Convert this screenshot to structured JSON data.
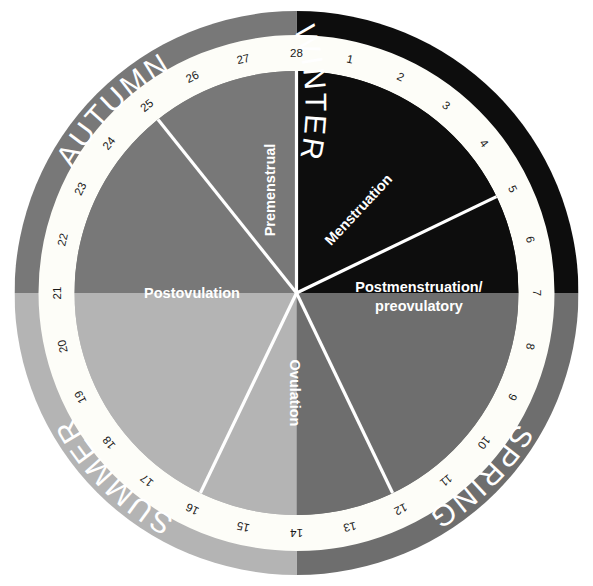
{
  "diagram": {
    "type": "radial-cycle-diagram",
    "cycle_length_days": 28,
    "colors": {
      "background": "#ffffff",
      "winter": "#0d0d0d",
      "spring": "#6e6e6e",
      "summer": "#b4b4b4",
      "autumn": "#787878",
      "ring_band": "#fdfdf8",
      "divider_line": "#ffffff",
      "day_number_text": "#1a1a1a",
      "season_text": "#ffffff",
      "phase_text": "#ffffff"
    },
    "seasons": [
      {
        "name": "winter",
        "label": "WINTER",
        "color": "#0d0d0d",
        "start_day": 28,
        "end_day": 7,
        "quadrant": "top-right"
      },
      {
        "name": "spring",
        "label": "SPRING",
        "color": "#6e6e6e",
        "start_day": 7,
        "end_day": 14,
        "quadrant": "bottom-right"
      },
      {
        "name": "summer",
        "label": "SUMMER",
        "color": "#b4b4b4",
        "start_day": 14,
        "end_day": 21,
        "quadrant": "bottom-left"
      },
      {
        "name": "autumn",
        "label": "AUTUMN",
        "color": "#787878",
        "start_day": 21,
        "end_day": 28,
        "quadrant": "top-left"
      }
    ],
    "day_numbers": [
      1,
      2,
      3,
      4,
      5,
      6,
      7,
      8,
      9,
      10,
      11,
      12,
      13,
      14,
      15,
      16,
      17,
      18,
      19,
      20,
      21,
      22,
      23,
      24,
      25,
      26,
      27,
      28
    ],
    "phases": [
      {
        "name": "menstruation",
        "label": "Menstruation",
        "start_day": 28,
        "end_day": 5,
        "sector_color": "#0d0d0d"
      },
      {
        "name": "postmenstruation-preovulatory",
        "label": "Postmenstruation/",
        "label_line2": "preovulatory",
        "start_day": 5,
        "end_day": 12
      },
      {
        "name": "ovulation",
        "label": "Ovulation",
        "start_day": 12,
        "end_day": 16
      },
      {
        "name": "postovulation",
        "label": "Postovulation",
        "start_day": 16,
        "end_day": 25
      },
      {
        "name": "premenstrual",
        "label": "Premenstrual",
        "start_day": 25,
        "end_day": 28
      }
    ],
    "sector_dividers_at_days": [
      28,
      5,
      12,
      16,
      25
    ]
  }
}
